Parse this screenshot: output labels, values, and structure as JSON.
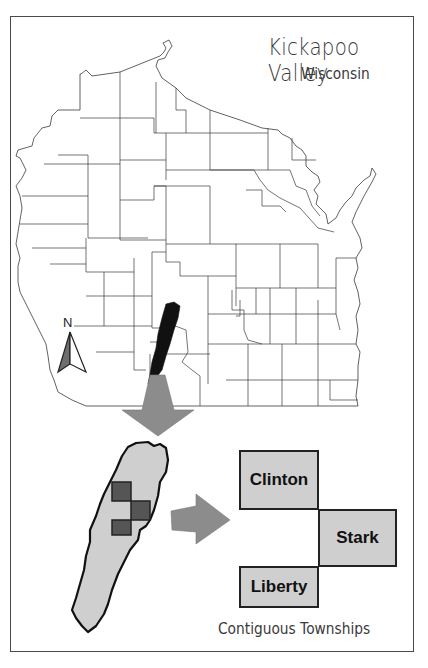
{
  "map": {
    "title": "Kickapoo Valley",
    "subtitle": "Wisconsin",
    "north_arrow_label": "N",
    "footer_label": "Contiguous Townships",
    "region_highlight": "Kickapoo Valley watershed",
    "townships": [
      {
        "name": "Clinton"
      },
      {
        "name": "Stark"
      },
      {
        "name": "Liberty"
      }
    ],
    "colors": {
      "frame": "#4a4a4a",
      "county_lines": "#3a3a3a",
      "watershed_state": "#111111",
      "watershed_fill": "#cfcfcf",
      "township_fill": "#cfcfcf",
      "township_inset_fill": "#555555",
      "arrow_fill": "#8c8c8c",
      "text": "#3a3a3a"
    }
  }
}
